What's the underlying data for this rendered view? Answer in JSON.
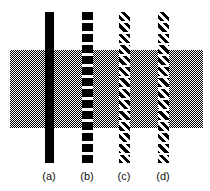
{
  "figure": {
    "background_color": "#ffffff",
    "width": 210,
    "height": 191
  },
  "gray_band": {
    "name": "gray-band",
    "description": "dithered 50% gray horizontal band",
    "color": "#808080",
    "x": 10,
    "y": 50,
    "width": 193,
    "height": 78
  },
  "bars": [
    {
      "id": "a",
      "label": "(a)",
      "pattern": "solid",
      "color": "#000000",
      "x": 45,
      "y": 12,
      "width": 9,
      "height": 151
    },
    {
      "id": "b",
      "label": "(b)",
      "pattern": "dashed",
      "color": "#000000",
      "x": 82,
      "y": 12,
      "width": 11,
      "height": 151
    },
    {
      "id": "c",
      "label": "(c)",
      "pattern": "diagonal-hatch",
      "color": "#000000",
      "x": 119,
      "y": 12,
      "width": 11,
      "height": 151
    },
    {
      "id": "d",
      "label": "(d)",
      "pattern": "diagonal-hatch",
      "color": "#000000",
      "x": 158,
      "y": 12,
      "width": 11,
      "height": 151
    }
  ],
  "labels": {
    "a": "(a)",
    "b": "(b)",
    "c": "(c)",
    "d": "(d)"
  }
}
